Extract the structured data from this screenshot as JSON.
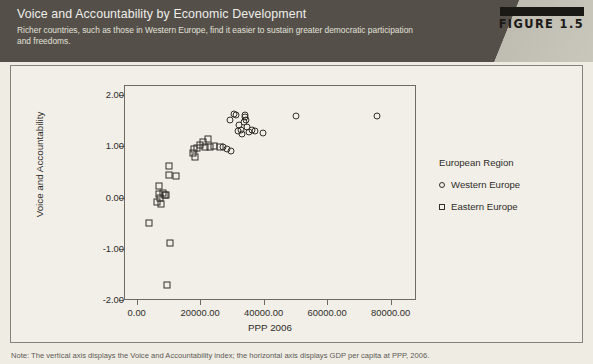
{
  "header": {
    "title": "Voice and Accountability by Economic Development",
    "subtitle": "Richer countries, such as those in Western Europe, find it easier to sustain greater democratic participation and freedoms.",
    "figure_badge": "FIGURE 1.5",
    "band_color": "#545049",
    "wedge_color": "#c2bfb5",
    "badge_bar_color": "#1b1916"
  },
  "note": {
    "text": "Note: The vertical axis displays the Voice and Accountability index; the horizontal axis displays GDP per capita at PPP, 2006."
  },
  "legend": {
    "title": "European Region",
    "entries": [
      {
        "label": "Western Europe",
        "marker": "circle"
      },
      {
        "label": "Eastern Europe",
        "marker": "square"
      }
    ]
  },
  "chart_data": {
    "type": "scatter",
    "title": "Voice and Accountability by Economic Development",
    "xlabel": "PPP 2006",
    "ylabel": "Voice and Accountability",
    "xlim": [
      -4000,
      88000
    ],
    "ylim": [
      -2.0,
      2.2
    ],
    "grid": false,
    "legend_position": "right",
    "xticks": [
      0,
      20000,
      40000,
      60000,
      80000
    ],
    "xtick_labels": [
      "0.00",
      "20000.00",
      "40000.00",
      "60000.00",
      "80000.00"
    ],
    "yticks": [
      2.0,
      1.0,
      0.0,
      -1.0,
      -2.0
    ],
    "ytick_labels": [
      "2.00",
      "1.00",
      "0.00",
      "-1.00",
      "-2.00"
    ],
    "series": [
      {
        "name": "Western Europe",
        "marker": "circle",
        "points": [
          [
            29500,
            1.52
          ],
          [
            30600,
            1.63
          ],
          [
            31400,
            1.62
          ],
          [
            32200,
            1.42
          ],
          [
            32000,
            1.3
          ],
          [
            32900,
            1.33
          ],
          [
            33100,
            1.25
          ],
          [
            33700,
            1.47
          ],
          [
            34000,
            1.58
          ],
          [
            34200,
            1.62
          ],
          [
            34500,
            1.52
          ],
          [
            34700,
            1.38
          ],
          [
            35400,
            1.28
          ],
          [
            36300,
            1.33
          ],
          [
            37400,
            1.3
          ],
          [
            39800,
            1.26
          ],
          [
            27200,
            0.98
          ],
          [
            28300,
            0.95
          ],
          [
            29700,
            0.92
          ],
          [
            50200,
            1.6
          ],
          [
            75600,
            1.6
          ]
        ]
      },
      {
        "name": "Eastern Europe",
        "marker": "square",
        "points": [
          [
            3800,
            -0.5
          ],
          [
            6500,
            -0.08
          ],
          [
            6900,
            0.22
          ],
          [
            7100,
            0.08
          ],
          [
            7400,
            0.0
          ],
          [
            7600,
            -0.12
          ],
          [
            8200,
            0.1
          ],
          [
            8900,
            0.05
          ],
          [
            9300,
            0.06
          ],
          [
            9600,
            -1.7
          ],
          [
            10400,
            -0.88
          ],
          [
            10200,
            0.45
          ],
          [
            10100,
            0.62
          ],
          [
            12300,
            0.42
          ],
          [
            17800,
            0.88
          ],
          [
            18200,
            0.95
          ],
          [
            18400,
            0.8
          ],
          [
            19100,
            0.96
          ],
          [
            20100,
            1.02
          ],
          [
            21000,
            1.08
          ],
          [
            21600,
            0.98
          ],
          [
            22400,
            1.14
          ],
          [
            23200,
            0.99
          ],
          [
            24500,
            1.0
          ],
          [
            26400,
            0.98
          ]
        ]
      }
    ]
  }
}
